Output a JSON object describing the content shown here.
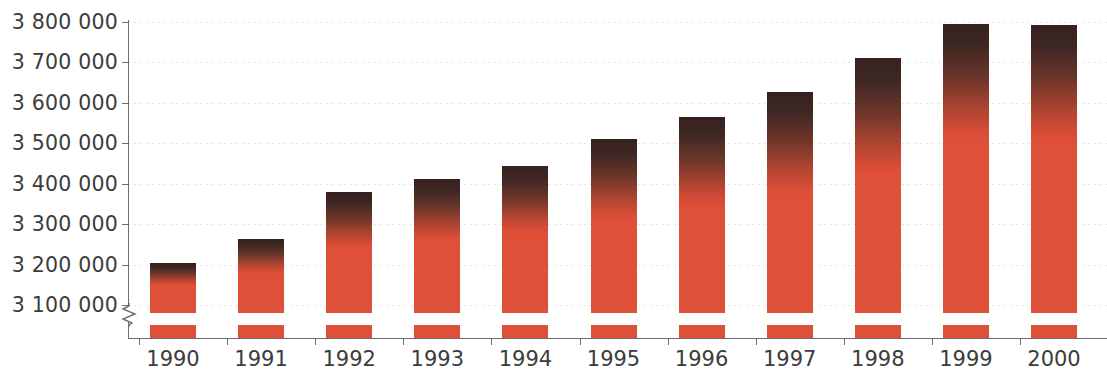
{
  "chart_data": {
    "type": "bar",
    "title": "",
    "subtitle": "",
    "xlabel": "",
    "ylabel": "",
    "categories": [
      "1990",
      "1991",
      "1992",
      "1993",
      "1994",
      "1995",
      "1996",
      "1997",
      "1998",
      "1999",
      "2000"
    ],
    "values": [
      3205000,
      3263000,
      3380000,
      3412000,
      3445000,
      3510000,
      3565000,
      3628000,
      3710000,
      3795000,
      3793000
    ],
    "series": [
      {
        "name": "",
        "values": [
          3205000,
          3263000,
          3380000,
          3412000,
          3445000,
          3510000,
          3565000,
          3628000,
          3710000,
          3795000,
          3793000
        ]
      }
    ],
    "ylim": [
      3100000,
      3800000
    ],
    "y_axis_broken": true,
    "y_tick_labels": [
      "3 800 000",
      "3 700 000",
      "3 600 000",
      "3 500 000",
      "3 400 000",
      "3 300 000",
      "3 200 000",
      "3 100 000"
    ],
    "y_tick_values": [
      3800000,
      3700000,
      3600000,
      3500000,
      3400000,
      3300000,
      3200000,
      3100000
    ],
    "x_tick_labels": [
      "1990",
      "1991",
      "1992",
      "1993",
      "1994",
      "1995",
      "1996",
      "1997",
      "1998",
      "1999",
      "2000"
    ],
    "grid": true,
    "grid_style": "dotted-horizontal",
    "legend": null,
    "legend_position": "none",
    "annotations": [],
    "colors": {
      "bar_fill": "#df5038",
      "bar_cap_dark": "#35211f",
      "gridline": "#e2e2e2",
      "axis": "#6e6e6e",
      "text": "#3c3c3c",
      "background": "#ffffff"
    }
  }
}
